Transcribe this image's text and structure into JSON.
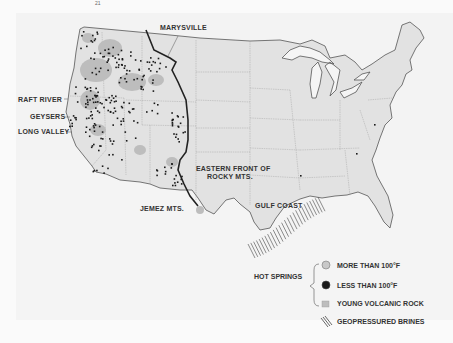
{
  "page_number": "21",
  "map": {
    "subject": "Geothermal resources of the contiguous United States",
    "labels": {
      "marysville": "MARYSVILLE",
      "raft_river": "RAFT RIVER",
      "geysers": "GEYSERS",
      "long_valley": "LONG VALLEY",
      "eastern_front_line1": "EASTERN FRONT OF",
      "eastern_front_line2": "ROCKY MTS.",
      "jemez": "JEMEZ MTS.",
      "gulf_coast": "GULF COAST"
    },
    "colors": {
      "land": "#e2e2e2",
      "volcanic": "#bdbdbd",
      "outline": "#555555",
      "dots": "#1a1a1a",
      "front_line": "#222222"
    }
  },
  "legend": {
    "group_label": "HOT SPRINGS",
    "items": [
      {
        "symbol": "light-circle",
        "label": "MORE THAN 100°F"
      },
      {
        "symbol": "dark-circle",
        "label": "LESS THAN 100°F"
      },
      {
        "symbol": "gray-square",
        "label": "YOUNG VOLCANIC ROCK"
      },
      {
        "symbol": "hatch-lines",
        "label": "GEOPRESSURED BRINES"
      }
    ]
  }
}
